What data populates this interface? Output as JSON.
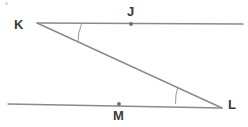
{
  "figure": {
    "canvas": {
      "width": 248,
      "height": 127,
      "background": "#ffffff"
    },
    "style": {
      "line_color": "#8a8a8a",
      "arc_color": "#9a9a9a",
      "point_color": "#6e6e6e",
      "label_color": "#3a3a3a",
      "line_width": 1.4,
      "arc_width": 1.0
    },
    "labels": {
      "K": "K",
      "J": "J",
      "M": "M",
      "L": "L"
    },
    "points": [
      {
        "name": "K",
        "label": "K",
        "x": 37,
        "y": 23,
        "dot": false
      },
      {
        "name": "J",
        "label": "J",
        "x": 131,
        "y": 24,
        "dot": true
      },
      {
        "name": "M",
        "label": "M",
        "x": 119,
        "y": 104,
        "dot": true
      },
      {
        "name": "L",
        "label": "L",
        "x": 222,
        "y": 108,
        "dot": false
      }
    ],
    "lines": [
      {
        "name": "line-KJ-top",
        "x1": 37,
        "y1": 23,
        "x2": 243,
        "y2": 24
      },
      {
        "name": "line-ML-bottom",
        "x1": 8,
        "y1": 104,
        "x2": 222,
        "y2": 108
      },
      {
        "name": "transversal-KL",
        "x1": 37,
        "y1": 23,
        "x2": 222,
        "y2": 108
      }
    ],
    "angle_arcs": [
      {
        "name": "angle-arc-K",
        "vertex": "K",
        "path": "M 81.5 24.0 A 46 46 0 0 0 78.0 42.5"
      },
      {
        "name": "angle-arc-L",
        "vertex": "L",
        "path": "M 177.8 87.2 A 48 48 0 0 0 175.5 104.0"
      }
    ]
  }
}
